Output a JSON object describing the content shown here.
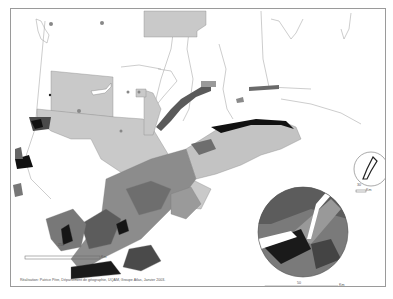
{
  "map": {
    "title": "",
    "region": "Southern Québec",
    "credit": "Réalisation: Patrice Pitre, Département de géographie, UQAM, Groupe Atlas, Janvier 2003.",
    "main_scale": {
      "value": "250",
      "unit": "Km"
    },
    "inset_large_scale": {
      "value": "50",
      "unit": "Km"
    },
    "inset_small_scale": {
      "value": "30",
      "unit": "Km"
    },
    "insets": [
      {
        "name": "Montréal region",
        "type": "circle"
      },
      {
        "name": "Îles-de-la-Madeleine",
        "type": "circle"
      }
    ],
    "colors": {
      "class_1": "#d0d0d0",
      "class_2": "#a8a8a8",
      "class_3": "#808080",
      "class_4": "#585858",
      "class_5": "#1e1e1e",
      "border": "#8a8a8a",
      "background": "#ffffff"
    }
  }
}
